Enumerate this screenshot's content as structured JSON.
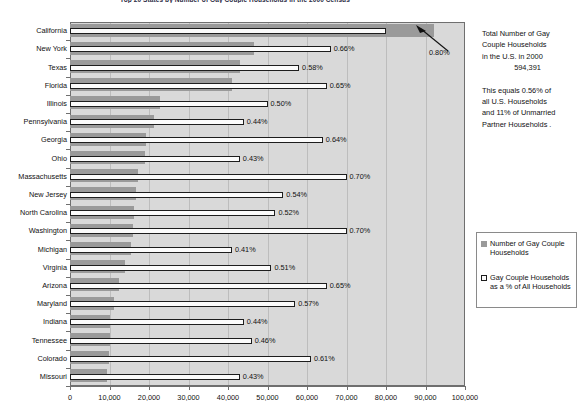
{
  "chart_data": {
    "type": "bar",
    "title": "Top 20 States by Number of Gay Couple Households in the 2000 Census",
    "xlabel": "",
    "ylabel": "",
    "xlim": [
      0,
      100000
    ],
    "xticks": [
      0,
      10000,
      20000,
      30000,
      40000,
      50000,
      60000,
      70000,
      80000,
      90000,
      100000
    ],
    "xtick_labels": [
      "0",
      "10,000",
      "20,000",
      "30,000",
      "40,000",
      "50,000",
      "60,000",
      "70,000",
      "80,000",
      "90,000",
      "100,000"
    ],
    "grid": true,
    "orientation": "horizontal",
    "legend_position": "right",
    "categories": [
      "California",
      "New York",
      "Texas",
      "Florida",
      "Illinois",
      "Pennsylvania",
      "Georgia",
      "Ohio",
      "Massachusetts",
      "New Jersey",
      "North Carolina",
      "Washington",
      "Michigan",
      "Virginia",
      "Arizona",
      "Maryland",
      "Indiana",
      "Tennessee",
      "Colorado",
      "Missouri"
    ],
    "series": [
      {
        "name": "Number of Gay Couple Households",
        "unit": "households",
        "values": [
          92138,
          46490,
          42912,
          41048,
          22887,
          21166,
          19288,
          18937,
          17099,
          16604,
          16198,
          15900,
          15368,
          13802,
          12332,
          11243,
          10219,
          10010,
          9753,
          9428
        ]
      },
      {
        "name": "Gay Couple Households as a % of All Households",
        "unit": "percent",
        "values": [
          0.8,
          0.66,
          0.58,
          0.65,
          0.5,
          0.44,
          0.64,
          0.43,
          0.7,
          0.54,
          0.52,
          0.7,
          0.41,
          0.51,
          0.65,
          0.57,
          0.44,
          0.46,
          0.61,
          0.43
        ],
        "labels": [
          "0.80%",
          "0.66%",
          "0.58%",
          "0.65%",
          "0.50%",
          "0.44%",
          "0.64%",
          "0.43%",
          "0.70%",
          "0.54%",
          "0.52%",
          "0.70%",
          "0.41%",
          "0.51%",
          "0.65%",
          "0.57%",
          "0.44%",
          "0.46%",
          "0.61%",
          "0.43%"
        ]
      }
    ],
    "annotations": [
      {
        "name": "california-callout",
        "text": "0.80%",
        "target": "California"
      }
    ]
  },
  "legend": {
    "entries": [
      {
        "label": "Number of Gay Couple Households",
        "swatch": "gray-fill"
      },
      {
        "label": "Gay Couple Households as a % of All Households",
        "swatch": "white-outline"
      }
    ]
  },
  "annotation": {
    "line1": "Total Number of Gay",
    "line2": "Couple Households",
    "line3": "in the U.S. in 2000",
    "total": "594,391",
    "line4": "This equals 0.56% of",
    "line5": "all U.S. Households",
    "line6": "and 11% of Unmarried",
    "line7": "Partner Households ."
  },
  "colors": {
    "bar_count_fill": "#9a9a9a",
    "bar_pct_fill": "#fbfbfb",
    "bar_pct_stroke": "#1d1d1d",
    "plot_background": "#d9d9d9",
    "gridline": "#bdbdbd",
    "axis": "#6f6f6f",
    "text": "#111111"
  }
}
